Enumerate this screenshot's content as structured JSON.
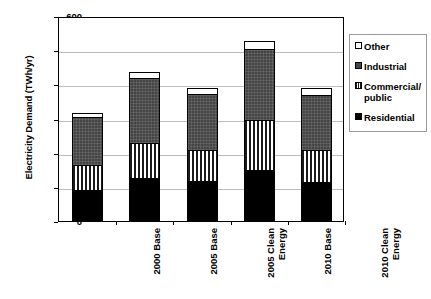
{
  "chart_data": {
    "type": "bar",
    "subtype": "stacked",
    "title": "",
    "xlabel": "",
    "ylabel": "Electricity Demand (TWh/yr)",
    "ylim": [
      0,
      600
    ],
    "ytick_values": [
      0,
      100,
      200,
      300,
      400,
      500,
      600
    ],
    "ytick_labels": [
      "0",
      "100",
      "200",
      "300",
      "400",
      "500",
      "600"
    ],
    "grid": true,
    "legend_position": "right",
    "categories": [
      "2000 Base",
      "2005 Base",
      "2005 Clean\nEnergy",
      "2010 Base",
      "2010 Clean\nEnergy"
    ],
    "series": [
      {
        "name": "Residential",
        "color": "#000000",
        "values": [
          88,
          123,
          114,
          146,
          111
        ]
      },
      {
        "name": "Commercial/\npublic",
        "color": "#ffffff",
        "values": [
          73,
          103,
          91,
          147,
          94
        ]
      },
      {
        "name": "Industrial",
        "color": "#454545",
        "values": [
          144,
          193,
          167,
          210,
          164
        ]
      },
      {
        "name": "Other",
        "color": "#ffffff",
        "values": [
          11,
          17,
          17,
          23,
          20
        ]
      }
    ],
    "totals": [
      316,
      436,
      389,
      526,
      389
    ]
  },
  "legend": {
    "items": [
      {
        "label": "Other",
        "swatch": "legend-swatch-other"
      },
      {
        "label": "Industrial",
        "swatch": "legend-swatch-industrial"
      },
      {
        "label": "Commercial/\npublic",
        "swatch": "legend-swatch-commercial"
      },
      {
        "label": "Residential",
        "swatch": "legend-swatch-residential"
      }
    ]
  }
}
